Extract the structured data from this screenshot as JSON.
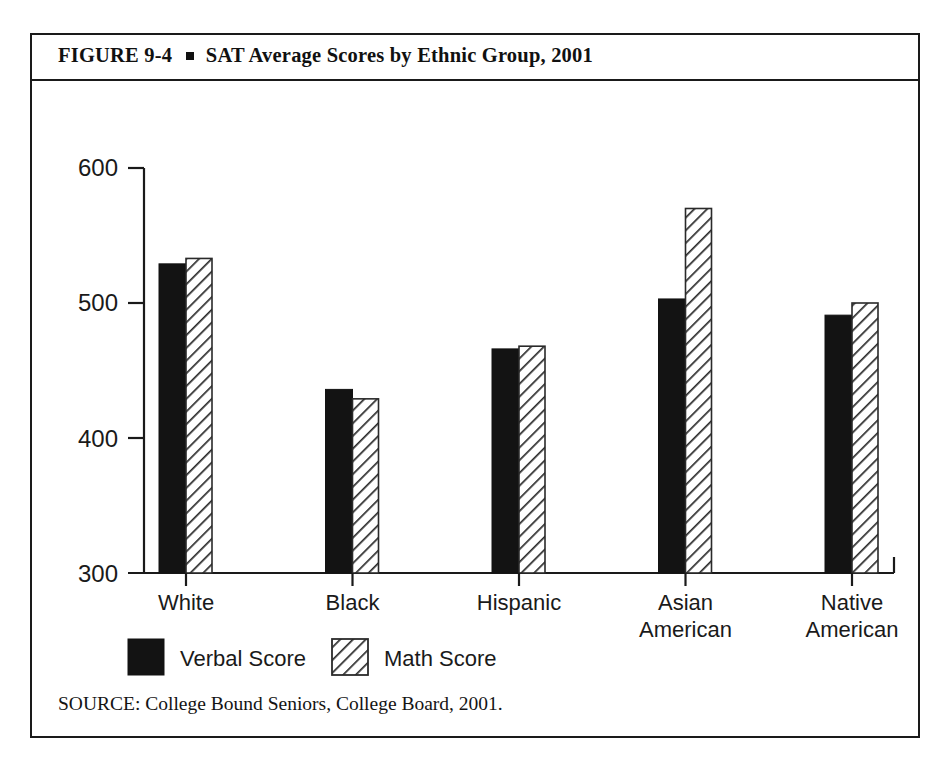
{
  "figure": {
    "number": "FIGURE  9-4",
    "bullet_icon": "square-bullet",
    "title": "SAT Average Scores by Ethnic Group, 2001",
    "source": "SOURCE: College Bound Seniors, College Board, 2001."
  },
  "chart_data": {
    "type": "bar",
    "title": "SAT Average Scores by Ethnic Group, 2001",
    "xlabel": "",
    "ylabel": "",
    "ylim": [
      300,
      600
    ],
    "yticks": [
      300,
      400,
      500,
      600
    ],
    "grid": false,
    "legend_position": "bottom-left",
    "categories": [
      "White",
      "Black",
      "Hispanic",
      "Asian American",
      "Native American"
    ],
    "category_lines": [
      [
        "White"
      ],
      [
        "Black"
      ],
      [
        "Hispanic"
      ],
      [
        "Asian",
        "American"
      ],
      [
        "Native",
        "American"
      ]
    ],
    "series": [
      {
        "name": "Verbal Score",
        "fill": "solid-black",
        "color": "#131313",
        "values": [
          529,
          433,
          460,
          501,
          481
        ]
      },
      {
        "name": "Math Score",
        "fill": "diagonal-hatch",
        "color": "#ffffff",
        "values": [
          531,
          426,
          465,
          566,
          479
        ]
      }
    ],
    "plotted_heights": {
      "note": "values as read from the printed bars",
      "verbal": [
        529,
        436,
        466,
        503,
        491
      ],
      "math": [
        533,
        429,
        468,
        570,
        500
      ]
    }
  },
  "axis": {
    "ytick_labels": [
      "600",
      "500",
      "400",
      "300"
    ]
  },
  "legend": {
    "items": [
      {
        "label": "Verbal Score",
        "swatch": "solid-black-swatch"
      },
      {
        "label": "Math Score",
        "swatch": "hatched-swatch"
      }
    ]
  }
}
